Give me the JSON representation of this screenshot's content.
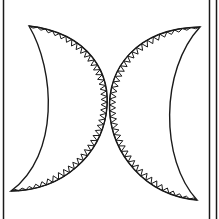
{
  "image": {
    "description": "Two facing crescent moon shapes with triangular sawtooth trim along their outer edges, black line art on white",
    "background": "#ffffff",
    "ink": "#1a1a1a"
  },
  "frame": {
    "left_line_x": 3,
    "right_lines_x": [
      209,
      216
    ],
    "stroke_width": 1.5
  },
  "crescents": [
    {
      "name": "left-crescent",
      "top_tip": [
        29,
        26
      ],
      "bottom_tip": [
        11,
        191
      ],
      "outer_ctrl": [
        150,
        40,
        120,
        190
      ],
      "inner_ctrl": [
        55,
        70,
        60,
        155
      ],
      "teeth_side": "outer"
    },
    {
      "name": "right-crescent",
      "top_tip": [
        200,
        27
      ],
      "bottom_tip": [
        197,
        200
      ],
      "outer_ctrl": [
        70,
        30,
        90,
        190
      ],
      "inner_ctrl": [
        160,
        70,
        160,
        160
      ],
      "teeth_side": "outer"
    }
  ],
  "teeth": {
    "count": 42,
    "depth": 6
  }
}
